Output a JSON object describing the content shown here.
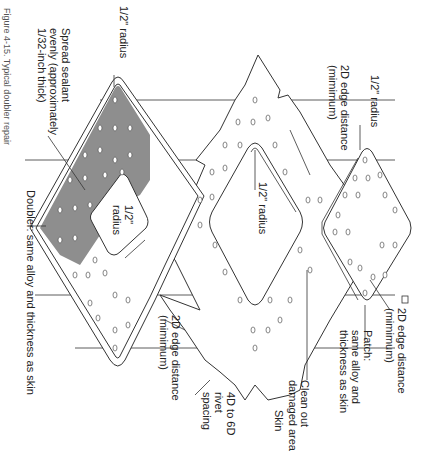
{
  "figure": {
    "caption": "Figure 4-15. Typical doubler repair",
    "orientation": "rotated 90 degrees clockwise"
  },
  "labels": {
    "radius_top_left": "1/2\" radius",
    "sealant_line1": "Spread sealant",
    "sealant_line2": "evenly (approximately",
    "sealant_line3": "1/32-inch thick)",
    "doubler": "Doubler: same alloy and thickness as skin",
    "radius_inner_doubler_1": "1/2\"",
    "radius_inner_doubler_2": "radius",
    "edge_distance_doubler_1": "2D edge distance",
    "edge_distance_doubler_2": "(mimimum)",
    "rivet_spacing_1": "4D to 6D",
    "rivet_spacing_2": "rivet",
    "rivet_spacing_3": "spacing",
    "skin": "Skin",
    "radius_center": "1/2\" radius",
    "edge_distance_center_1": "2D edge distance",
    "edge_distance_center_2": "(mimimum)",
    "clean_out_1": "Clean out",
    "clean_out_2": "damaged area",
    "radius_patch": "1/2\" radius",
    "edge_distance_patch_1": "2D edge distance",
    "edge_distance_patch_2": "(mimimum)",
    "patch_1": "Patch:",
    "patch_2": "same alloy and",
    "patch_3": "thickness as skin"
  },
  "colors": {
    "sealant": "#8e8e8e",
    "outline": "#333333",
    "background": "#ffffff"
  }
}
